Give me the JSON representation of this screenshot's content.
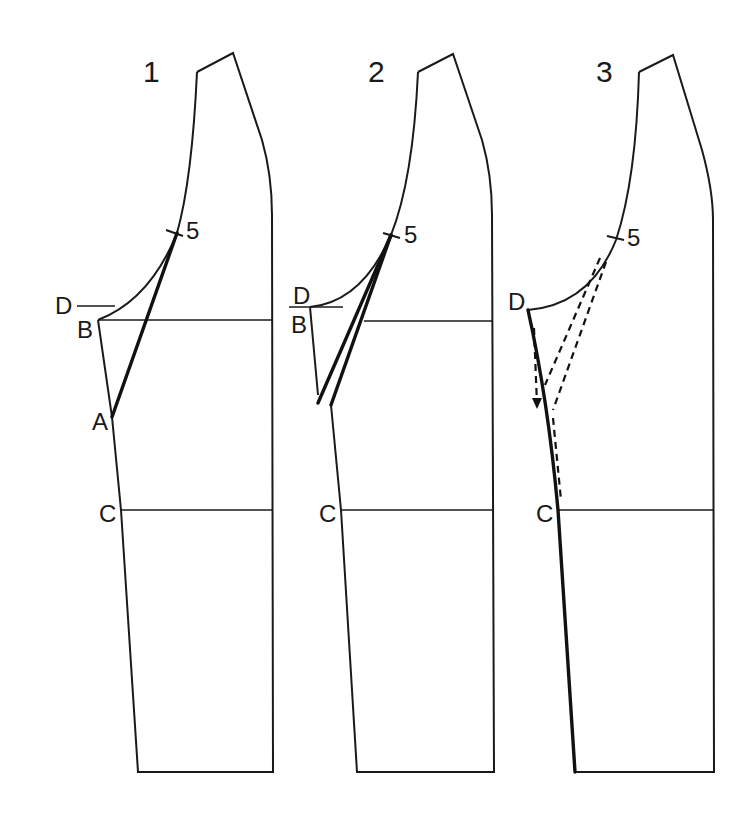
{
  "figure": {
    "stroke_color": "#1a1a1a",
    "background": "#ffffff"
  },
  "panels": [
    {
      "number": "1",
      "labels": {
        "point5": "5",
        "D": "D",
        "B": "B",
        "A": "A",
        "C": "C"
      }
    },
    {
      "number": "2",
      "labels": {
        "point5": "5",
        "D": "D",
        "B": "B",
        "C": "C"
      }
    },
    {
      "number": "3",
      "labels": {
        "point5": "5",
        "D": "D",
        "C": "C"
      }
    }
  ]
}
